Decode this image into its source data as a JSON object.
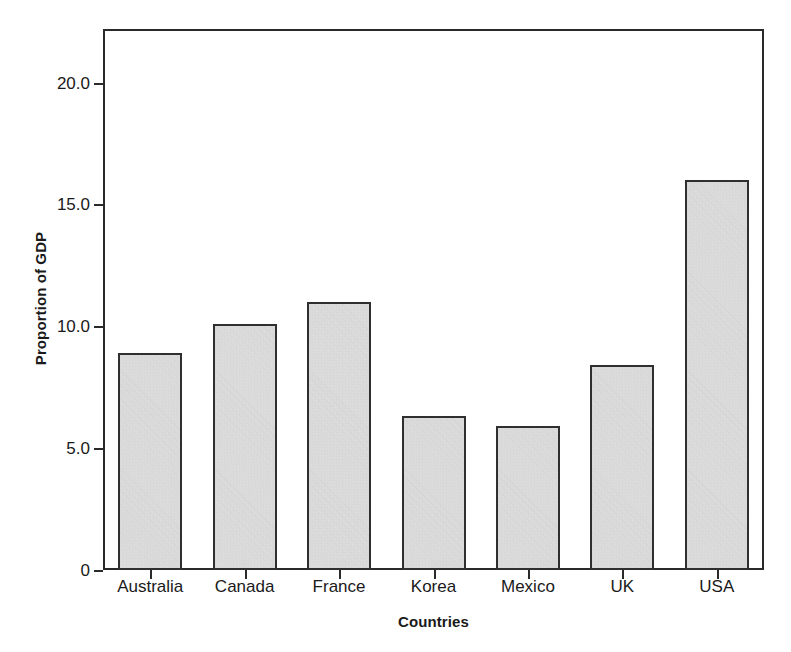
{
  "chart_data": {
    "type": "bar",
    "title": "",
    "xlabel": "Countries",
    "ylabel": "Proportion of GDP",
    "categories": [
      "Australia",
      "Canada",
      "France",
      "Korea",
      "Mexico",
      "UK",
      "USA"
    ],
    "values": [
      8.9,
      10.1,
      11.0,
      6.3,
      5.9,
      8.4,
      16.0
    ],
    "ylim": [
      0,
      22.2
    ],
    "yticks": [
      0,
      5.0,
      10.0,
      15.0,
      20.0
    ],
    "ytick_labels": [
      "0",
      "5.0",
      "10.0",
      "15.0",
      "20.0"
    ],
    "grid": false,
    "legend": null,
    "bar_fill_color": "#e9e9e9",
    "bar_edge_color": "#2f2f2f",
    "axis_color": "#2a2a2a",
    "background_color": "#ffffff"
  },
  "axis": {
    "y_title": "Proportion of GDP",
    "x_title": "Countries"
  }
}
